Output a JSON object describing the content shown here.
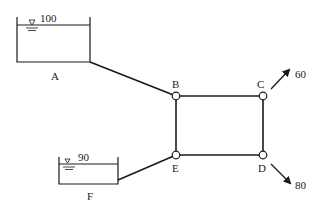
{
  "diagram": {
    "type": "pipe-network",
    "colors": {
      "line": "#1a1a1a",
      "node_fill": "#ffffff"
    },
    "reservoirs": [
      {
        "id": "A",
        "label": "A",
        "water_level": "100"
      },
      {
        "id": "F",
        "label": "F",
        "water_level": "90"
      }
    ],
    "nodes": [
      {
        "id": "B",
        "label": "B"
      },
      {
        "id": "C",
        "label": "C"
      },
      {
        "id": "D",
        "label": "D"
      },
      {
        "id": "E",
        "label": "E"
      }
    ],
    "outflows": [
      {
        "node": "C",
        "value": "60"
      },
      {
        "node": "D",
        "value": "80"
      }
    ],
    "pipes": [
      {
        "from": "A",
        "to": "B"
      },
      {
        "from": "B",
        "to": "C"
      },
      {
        "from": "C",
        "to": "D"
      },
      {
        "from": "D",
        "to": "E"
      },
      {
        "from": "E",
        "to": "B"
      },
      {
        "from": "F",
        "to": "E"
      }
    ]
  }
}
